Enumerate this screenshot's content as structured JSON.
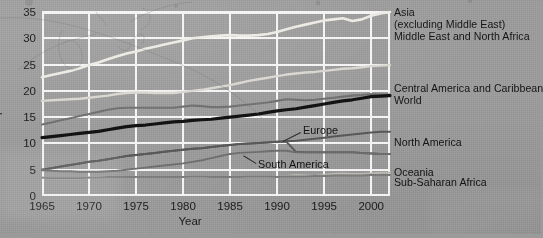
{
  "figure": {
    "background_color": "#9a9a9a",
    "grid_color": "#f4f4f4",
    "axis_text_color": "#1c1c1c"
  },
  "axes": {
    "ylabel": "per cent",
    "xlabel": "Year",
    "yticks": [
      "0",
      "5",
      "10",
      "15",
      "20",
      "25",
      "30",
      "35"
    ],
    "xticks": [
      "1965",
      "1970",
      "1975",
      "1980",
      "1985",
      "1990",
      "1995",
      "2000"
    ]
  },
  "legend": {
    "position": "right",
    "entries": [
      {
        "label": "Asia",
        "sublabel": "(excluding Middle East)",
        "color": "#eceae3"
      },
      {
        "label": "Middle East and North Africa",
        "sublabel": "",
        "color": "#d8d6cf"
      },
      {
        "label": "Central America and Caribbean",
        "sublabel": "",
        "color": "#6f6f6f"
      },
      {
        "label": "World",
        "sublabel": "",
        "color": "#121212"
      },
      {
        "label": "North America",
        "sublabel": "",
        "color": "#585858"
      },
      {
        "label": "Oceania",
        "sublabel": "",
        "color": "#bdbbb4"
      },
      {
        "label": "Sub-Saharan Africa",
        "sublabel": "",
        "color": "#7e7e7e"
      }
    ]
  },
  "callouts": [
    {
      "label": "Europe",
      "color": "#585858"
    },
    {
      "label": "South America",
      "color": "#6f6f6f"
    }
  ],
  "chart_data": {
    "type": "line",
    "title": "",
    "subtitle": "",
    "xlabel": "Year",
    "ylabel": "per cent",
    "xlim": [
      1965,
      2002
    ],
    "ylim": [
      0,
      35
    ],
    "yticks": [
      0,
      5,
      10,
      15,
      20,
      25,
      30,
      35
    ],
    "xticks": [
      1965,
      1970,
      1975,
      1980,
      1985,
      1990,
      1995,
      2000
    ],
    "grid": true,
    "legend_position": "right-of-axes",
    "x": [
      1965,
      1966,
      1967,
      1968,
      1969,
      1970,
      1971,
      1972,
      1973,
      1974,
      1975,
      1976,
      1977,
      1978,
      1979,
      1980,
      1981,
      1982,
      1983,
      1984,
      1985,
      1986,
      1987,
      1988,
      1989,
      1990,
      1991,
      1992,
      1993,
      1994,
      1995,
      1996,
      1997,
      1998,
      1999,
      2000,
      2001,
      2002
    ],
    "series": [
      {
        "name": "Asia (excluding Middle East)",
        "color": "#eceae3",
        "width": 2.6,
        "values": [
          22.6,
          23.0,
          23.4,
          23.8,
          24.3,
          24.9,
          25.4,
          26.0,
          26.6,
          27.1,
          27.5,
          28.0,
          28.4,
          28.8,
          29.2,
          29.6,
          30.0,
          30.2,
          30.4,
          30.5,
          30.6,
          30.5,
          30.5,
          30.6,
          30.8,
          31.2,
          31.7,
          32.2,
          32.6,
          33.0,
          33.4,
          33.6,
          33.8,
          33.3,
          33.6,
          34.3,
          34.7,
          35.0
        ]
      },
      {
        "name": "Middle East and North Africa",
        "color": "#d8d6cf",
        "width": 2.4,
        "values": [
          18.1,
          18.2,
          18.3,
          18.4,
          18.5,
          18.7,
          18.9,
          19.1,
          19.4,
          19.6,
          19.7,
          19.7,
          19.6,
          19.6,
          19.6,
          19.8,
          20.0,
          20.2,
          20.5,
          20.8,
          21.1,
          21.5,
          21.9,
          22.2,
          22.5,
          22.8,
          23.1,
          23.3,
          23.5,
          23.6,
          23.8,
          24.0,
          24.2,
          24.3,
          24.5,
          24.7,
          24.8,
          24.9
        ]
      },
      {
        "name": "Central America and Caribbean",
        "color": "#6f6f6f",
        "width": 2.1,
        "values": [
          13.6,
          14.0,
          14.4,
          14.8,
          15.2,
          15.6,
          16.0,
          16.4,
          16.7,
          16.8,
          16.8,
          16.8,
          16.8,
          16.8,
          16.8,
          17.0,
          17.2,
          17.1,
          16.9,
          16.9,
          17.0,
          17.2,
          17.4,
          17.6,
          17.8,
          18.1,
          18.4,
          18.3,
          18.2,
          18.3,
          18.5,
          18.7,
          18.9,
          19.1,
          19.2,
          19.4,
          19.3,
          19.3
        ]
      },
      {
        "name": "World",
        "color": "#121212",
        "width": 3.2,
        "values": [
          11.1,
          11.3,
          11.5,
          11.7,
          11.9,
          12.1,
          12.3,
          12.6,
          12.9,
          13.2,
          13.4,
          13.5,
          13.7,
          13.9,
          14.1,
          14.2,
          14.4,
          14.5,
          14.6,
          14.8,
          15.0,
          15.2,
          15.4,
          15.6,
          15.9,
          16.2,
          16.4,
          16.6,
          16.9,
          17.2,
          17.5,
          17.8,
          18.1,
          18.3,
          18.6,
          18.9,
          19.0,
          19.1
        ]
      },
      {
        "name": "Europe",
        "color": "#585858",
        "width": 2.0,
        "values": [
          5.0,
          5.3,
          5.6,
          5.9,
          6.2,
          6.5,
          6.7,
          7.0,
          7.3,
          7.6,
          7.8,
          8.0,
          8.2,
          8.4,
          8.6,
          8.8,
          9.0,
          9.1,
          9.3,
          9.5,
          9.7,
          9.9,
          10.0,
          10.1,
          10.2,
          10.3,
          10.3,
          8.4,
          8.3,
          8.3,
          8.3,
          8.3,
          8.3,
          8.3,
          8.2,
          8.1,
          8.0,
          8.0
        ]
      },
      {
        "name": "North America",
        "color": "#585858",
        "width": 2.0,
        "values": [
          5.0,
          5.3,
          5.6,
          5.9,
          6.2,
          6.5,
          6.7,
          7.0,
          7.3,
          7.6,
          7.8,
          8.0,
          8.2,
          8.4,
          8.6,
          8.8,
          9.0,
          9.1,
          9.3,
          9.5,
          9.7,
          9.9,
          10.0,
          10.1,
          10.2,
          10.3,
          10.4,
          10.5,
          10.7,
          10.9,
          11.1,
          11.3,
          11.5,
          11.7,
          11.9,
          12.1,
          12.2,
          12.2
        ]
      },
      {
        "name": "South America",
        "color": "#6f6f6f",
        "width": 1.9,
        "values": [
          4.9,
          4.8,
          4.7,
          4.7,
          4.6,
          4.6,
          4.6,
          4.7,
          4.8,
          5.0,
          5.2,
          5.4,
          5.6,
          5.8,
          6.0,
          6.2,
          6.5,
          6.8,
          7.2,
          7.6,
          8.0,
          8.2,
          8.3,
          8.4,
          8.5,
          8.6,
          8.6,
          8.3,
          8.3,
          8.3,
          8.3,
          8.3,
          8.3,
          8.3,
          8.2,
          8.1,
          8.0,
          8.0
        ]
      },
      {
        "name": "Oceania",
        "color": "#bdbbb4",
        "width": 2.0,
        "values": [
          3.5,
          3.4,
          3.4,
          3.4,
          3.4,
          3.5,
          3.5,
          3.6,
          3.6,
          3.6,
          3.6,
          3.6,
          3.6,
          3.6,
          3.6,
          3.6,
          3.7,
          3.7,
          3.6,
          3.6,
          3.6,
          3.6,
          3.7,
          3.7,
          3.7,
          3.6,
          3.8,
          4.0,
          3.9,
          3.8,
          4.0,
          4.2,
          4.3,
          4.2,
          4.2,
          4.3,
          4.4,
          4.4
        ]
      },
      {
        "name": "Sub-Saharan Africa",
        "color": "#7e7e7e",
        "width": 1.9,
        "values": [
          3.5,
          3.4,
          3.4,
          3.4,
          3.4,
          3.5,
          3.5,
          3.6,
          3.6,
          3.6,
          3.6,
          3.6,
          3.6,
          3.6,
          3.6,
          3.6,
          3.7,
          3.7,
          3.6,
          3.6,
          3.6,
          3.6,
          3.7,
          3.7,
          3.7,
          3.6,
          3.7,
          3.7,
          3.7,
          3.8,
          3.8,
          3.9,
          3.9,
          3.9,
          3.9,
          4.0,
          4.0,
          4.0
        ]
      }
    ]
  }
}
